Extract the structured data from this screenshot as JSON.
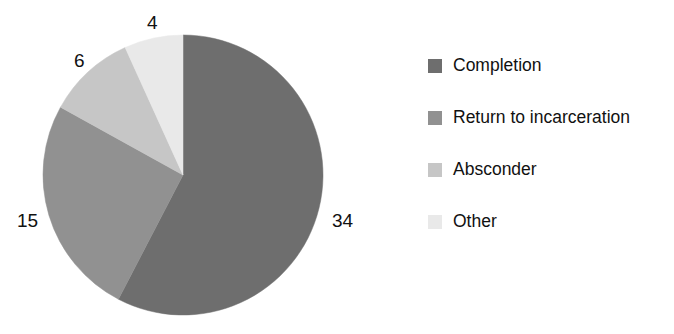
{
  "chart_data": {
    "type": "pie",
    "title": "",
    "categories": [
      "Completion",
      "Return to incarceration",
      "Absconder",
      "Other"
    ],
    "values": [
      34,
      15,
      6,
      4
    ],
    "labels": [
      "34",
      "15",
      "6",
      "4"
    ],
    "total": 59,
    "units": "count",
    "start_angle_deg": 0,
    "direction": "clockwise",
    "legend_position": "right",
    "grid": false,
    "colors": [
      "#6e6e6e",
      "#919191",
      "#c6c6c6",
      "#e9e9e9"
    ],
    "slices": [
      {
        "label": "Completion",
        "value": 34,
        "value_text": "34",
        "color": "#6e6e6e",
        "angle_deg": 207.5
      },
      {
        "label": "Return to incarceration",
        "value": 15,
        "value_text": "15",
        "color": "#919191",
        "angle_deg": 91.5
      },
      {
        "label": "Absconder",
        "value": 6,
        "value_text": "6",
        "color": "#c6c6c6",
        "angle_deg": 36.6
      },
      {
        "label": "Other",
        "value": 4,
        "value_text": "4",
        "color": "#e9e9e9",
        "angle_deg": 24.4
      }
    ]
  },
  "legend": {
    "items": [
      {
        "label": "Completion",
        "color": "#6e6e6e"
      },
      {
        "label": "Return to incarceration",
        "color": "#919191"
      },
      {
        "label": "Absconder",
        "color": "#c6c6c6"
      },
      {
        "label": "Other",
        "color": "#e9e9e9"
      }
    ]
  },
  "pie_geometry": {
    "cx": 183,
    "cy": 175,
    "r": 140
  }
}
